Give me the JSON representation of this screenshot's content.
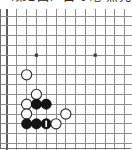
{
  "caption": {
    "text": "〈第2図〉白の砲 黒先手"
  },
  "board": {
    "title": "go-board-diagram",
    "game": "Go",
    "grid": {
      "columns": 13,
      "rows": 13,
      "spacing_px": 9.8,
      "origin_x_px": 7,
      "origin_y_px": 7,
      "line_color": "#8e8e92",
      "edge_color": "#5d5d61",
      "background_color": "#fefefe",
      "show_grid": true
    },
    "star_points": [
      {
        "col": 3,
        "row": 4
      },
      {
        "col": 9,
        "row": 4
      }
    ],
    "stones": [
      {
        "color": "white",
        "col": 2,
        "row": 6,
        "label": ""
      },
      {
        "color": "white",
        "col": 3,
        "row": 8,
        "label": ""
      },
      {
        "color": "white",
        "col": 2,
        "row": 9,
        "label": ""
      },
      {
        "color": "black",
        "col": 3,
        "row": 9,
        "label": ""
      },
      {
        "color": "black",
        "col": 4,
        "row": 9,
        "label": ""
      },
      {
        "color": "white",
        "col": 2,
        "row": 10,
        "label": ""
      },
      {
        "color": "white",
        "col": 6,
        "row": 10,
        "label": ""
      },
      {
        "color": "black",
        "col": 2,
        "row": 11,
        "label": ""
      },
      {
        "color": "black",
        "col": 3,
        "row": 11,
        "label": ""
      },
      {
        "color": "black",
        "col": 4,
        "row": 11,
        "label": "1"
      },
      {
        "color": "white",
        "col": 5,
        "row": 11,
        "label": ""
      }
    ],
    "stone_colors": {
      "black_fill": "#141414",
      "black_stroke": "#000000",
      "white_fill": "#fbfbfb",
      "white_stroke": "#2c2c2c",
      "mark_color": "#ffffff"
    },
    "stone_radius_px": 5.1,
    "marked_move_number": "1"
  }
}
